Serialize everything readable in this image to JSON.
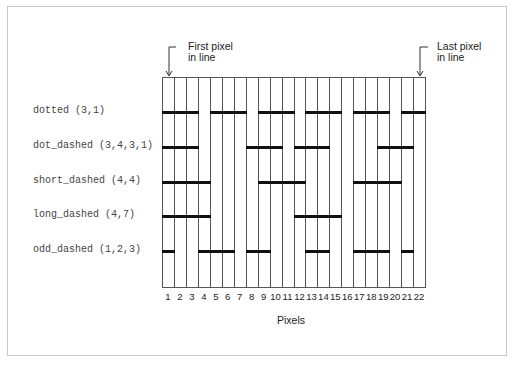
{
  "annotations": {
    "first_pixel_line1": "First pixel",
    "first_pixel_line2": "in line",
    "last_pixel_line1": "Last pixel",
    "last_pixel_line2": "in line"
  },
  "axis": {
    "title": "Pixels",
    "ticks": [
      "1",
      "2",
      "3",
      "4",
      "5",
      "6",
      "7",
      "8",
      "9",
      "10",
      "11",
      "12",
      "13",
      "14",
      "15",
      "16",
      "17",
      "18",
      "19",
      "20",
      "21",
      "22"
    ]
  },
  "rows": [
    {
      "label": "dotted (3,1)",
      "on": [
        1,
        2,
        3,
        5,
        6,
        7,
        9,
        10,
        11,
        13,
        14,
        15,
        17,
        18,
        19,
        21,
        22
      ]
    },
    {
      "label": "dot_dashed (3,4,3,1)",
      "on": [
        1,
        2,
        3,
        8,
        9,
        10,
        12,
        13,
        14,
        19,
        20,
        21
      ]
    },
    {
      "label": "short_dashed (4,4)",
      "on": [
        1,
        2,
        3,
        4,
        9,
        10,
        11,
        12,
        17,
        18,
        19,
        20
      ]
    },
    {
      "label": "long_dashed (4,7)",
      "on": [
        1,
        2,
        3,
        4,
        12,
        13,
        14,
        15
      ]
    },
    {
      "label": "odd_dashed (1,2,3)",
      "on": [
        1,
        4,
        5,
        6,
        8,
        9,
        13,
        14,
        17,
        18,
        19,
        21
      ]
    }
  ],
  "colors": {
    "grid": "#555555",
    "dash": "#111111",
    "frame": "#c8c8c8"
  }
}
